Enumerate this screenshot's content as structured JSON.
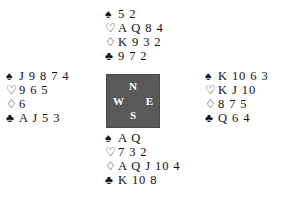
{
  "diagram": {
    "type": "bridge-deal-diagram",
    "background_color": "#ffffff",
    "text_color": "#111111"
  },
  "suits": {
    "spade": "♠",
    "heart": "♡",
    "diamond": "♢",
    "club": "♣"
  },
  "compass": {
    "background_color": "#595959",
    "label_color": "#ffffff",
    "north": "N",
    "west": "W",
    "east": "E",
    "south": "S"
  },
  "hands": {
    "north": {
      "position_label": "N",
      "spades": "5 2",
      "hearts": "A Q 8 4",
      "diamonds": "K 9 3 2",
      "clubs": "9 7 2"
    },
    "west": {
      "position_label": "W",
      "spades": "J 9 8 7 4",
      "hearts": "9 6 5",
      "diamonds": "6",
      "clubs": "A J 5 3"
    },
    "east": {
      "position_label": "E",
      "spades": "K 10 6 3",
      "hearts": "K J 10",
      "diamonds": "8 7 5",
      "clubs": "Q 6 4"
    },
    "south": {
      "position_label": "S",
      "spades": "A Q",
      "hearts": "7 3 2",
      "diamonds": "A Q J 10 4",
      "clubs": "K 10 8"
    }
  }
}
